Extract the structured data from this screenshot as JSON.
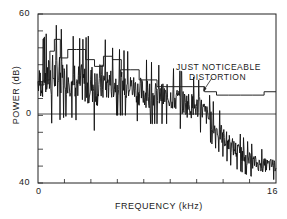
{
  "chart_data": {
    "type": "line",
    "title": "",
    "xlabel": "FREQUENCY (kHz)",
    "ylabel": "POWER (dB)",
    "xlim": [
      0,
      16
    ],
    "ylim": [
      -40,
      60
    ],
    "x_tick_labels": [
      "0",
      "16"
    ],
    "y_tick_labels": [
      "60",
      "0",
      "40"
    ],
    "x_minor_ticks": 9,
    "grid": false,
    "reference_line_y": 0,
    "annotation": {
      "text_line1": "JUST NOTICEABLE",
      "text_line2": "DISTORTION",
      "points_to": {
        "x": 11.1,
        "y": 14
      }
    },
    "series": [
      {
        "name": "Just noticeable distortion (staircase)",
        "style": "step",
        "x": [
          0,
          0.4,
          0.8,
          1.1,
          1.5,
          2.0,
          2.6,
          3.2,
          3.8,
          4.4,
          5.0,
          5.6,
          6.2,
          6.8,
          7.4,
          8.0,
          8.8,
          9.6,
          10.4,
          11.2,
          12.0,
          12.8,
          13.6,
          14.4,
          15.2,
          16.0
        ],
        "y": [
          18,
          21,
          38,
          45,
          34,
          39,
          39,
          33,
          29,
          35,
          33,
          27,
          27,
          21,
          21,
          17,
          17,
          17,
          17,
          14,
          12,
          12,
          12,
          12,
          14,
          14
        ]
      },
      {
        "name": "Signal power spectrum",
        "style": "line",
        "envelope_x": [
          0,
          1,
          2,
          3,
          4,
          5,
          6,
          7,
          8,
          9,
          10,
          11,
          12,
          13,
          14,
          15,
          16
        ],
        "envelope_peak_y": [
          40,
          55,
          48,
          45,
          50,
          40,
          38,
          34,
          30,
          28,
          25,
          20,
          5,
          -5,
          -15,
          -20,
          -20
        ],
        "envelope_trough_y": [
          0,
          -5,
          0,
          -5,
          -10,
          0,
          0,
          -5,
          -5,
          -5,
          -10,
          -10,
          -20,
          -30,
          -35,
          -38,
          -38
        ]
      }
    ]
  }
}
